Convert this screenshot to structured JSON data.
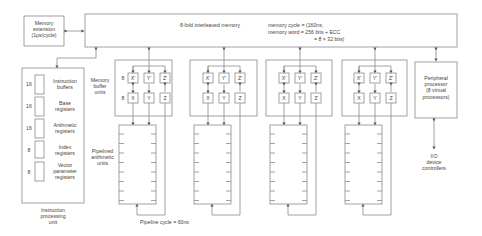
{
  "memory_extension": {
    "line1": "Memory",
    "line2": "extension",
    "line3": "(1µs/cycle)"
  },
  "main_memory": {
    "title": "8-fold interleaved memory",
    "cycle": "memory cycle = (160ns;",
    "word": "memory word = 256 bits + ECC",
    "word2": "= 8 × 32 bits)"
  },
  "instruction_unit": {
    "registers": [
      {
        "count": "16",
        "line1": "Instruction",
        "line2": "buffers"
      },
      {
        "count": "16",
        "line1": "Base",
        "line2": "registers"
      },
      {
        "count": "16",
        "line1": "Arithmetic",
        "line2": "registers"
      },
      {
        "count": "8",
        "line1": "Index",
        "line2": "registers"
      },
      {
        "count": "8",
        "line1": "Vector",
        "line2": "parameter",
        "line3": "registers"
      }
    ],
    "caption1": "Instruction",
    "caption2": "processing",
    "caption3": "unit"
  },
  "buffer_units": {
    "label1": "Memory",
    "label2": "buffer",
    "label3": "units",
    "count_top": "8",
    "count_bottom": "8",
    "top_row": [
      "X'",
      "Y'",
      "Z'"
    ],
    "bottom_row": [
      "X",
      "Y",
      "Z"
    ]
  },
  "pipelines": {
    "label1": "Pipelined",
    "label2": "arithmetic",
    "label3": "units",
    "cycle": "Pipeline cycle = 60ns"
  },
  "peripheral": {
    "line1": "Peripheral",
    "line2": "processor",
    "line3": "(8 virtual",
    "line4": "processors)"
  },
  "io": {
    "line1": "I/O",
    "line2": "device",
    "line3": "controllers"
  },
  "colors": {
    "stroke": "#8a8a8a",
    "text": "#444444"
  }
}
